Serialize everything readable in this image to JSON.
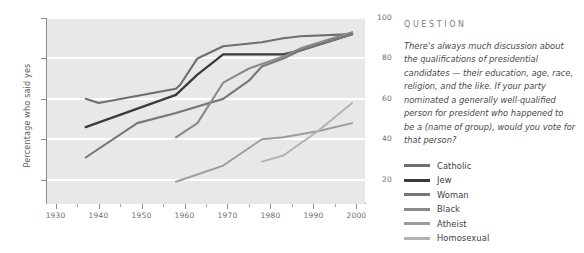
{
  "chart_data": {
    "type": "line",
    "title": "",
    "xlabel": "",
    "ylabel": "Percentage who said yes",
    "xlim": [
      1928,
      2002
    ],
    "ylim": [
      8,
      100
    ],
    "grid": true,
    "gridlines_y": [
      20,
      40,
      60,
      80,
      100
    ],
    "xticks": [
      1930,
      1940,
      1950,
      1960,
      1970,
      1980,
      1990,
      2000
    ],
    "xtick_labels": [
      "1930",
      "1940",
      "1950",
      "1960",
      "1970",
      "1980",
      "1990",
      "2000"
    ],
    "xticks_minor": [
      1935,
      1945,
      1955,
      1965,
      1975,
      1985,
      1995
    ],
    "yticks": [
      20,
      40,
      60,
      80,
      100
    ],
    "ytick_labels": [
      "20",
      "40",
      "60",
      "80",
      "100"
    ],
    "legend_position": "right",
    "series": [
      {
        "name": "Catholic",
        "color": "#6e6e6e",
        "width": 2.1,
        "points": [
          [
            1937,
            60
          ],
          [
            1940,
            58
          ],
          [
            1958,
            65
          ],
          [
            1959,
            67
          ],
          [
            1963,
            80
          ],
          [
            1969,
            86
          ],
          [
            1978,
            88
          ],
          [
            1983,
            90
          ],
          [
            1987,
            91
          ],
          [
            1999,
            92
          ]
        ]
      },
      {
        "name": "Jew",
        "color": "#3a3a3a",
        "width": 2.3,
        "points": [
          [
            1937,
            46
          ],
          [
            1958,
            62
          ],
          [
            1963,
            72
          ],
          [
            1969,
            82
          ],
          [
            1983,
            82
          ],
          [
            1987,
            84
          ],
          [
            1999,
            92
          ]
        ]
      },
      {
        "name": "Woman",
        "color": "#777777",
        "width": 2.1,
        "points": [
          [
            1937,
            31
          ],
          [
            1949,
            48
          ],
          [
            1958,
            53
          ],
          [
            1969,
            60
          ],
          [
            1975,
            69
          ],
          [
            1978,
            76
          ],
          [
            1983,
            80
          ],
          [
            1987,
            84
          ],
          [
            1999,
            92
          ]
        ]
      },
      {
        "name": "Black",
        "color": "#8a8a8a",
        "width": 2.1,
        "points": [
          [
            1958,
            41
          ],
          [
            1963,
            48
          ],
          [
            1969,
            68
          ],
          [
            1975,
            75
          ],
          [
            1983,
            81
          ],
          [
            1987,
            85
          ],
          [
            1999,
            93
          ]
        ]
      },
      {
        "name": "Atheist",
        "color": "#9c9c9c",
        "width": 1.9,
        "points": [
          [
            1958,
            19
          ],
          [
            1969,
            27
          ],
          [
            1978,
            40
          ],
          [
            1983,
            41
          ],
          [
            1991,
            44
          ],
          [
            1999,
            48
          ]
        ]
      },
      {
        "name": "Homosexual",
        "color": "#b2b2b2",
        "width": 1.9,
        "points": [
          [
            1978,
            29
          ],
          [
            1983,
            32
          ],
          [
            1991,
            44
          ],
          [
            1999,
            58
          ]
        ]
      }
    ]
  },
  "question": {
    "heading": "QUESTION",
    "body": "There's always much discussion about the qualifications of presidential candidates — their education, age, race, religion, and the like. If your party nominated a generally well-qualified person for president who happened to be a (name of group), would you vote for that person?"
  },
  "colors": {
    "plot_background": "#e8e8e8",
    "gridline": "#ffffff",
    "axis": "#8c8c8c",
    "tick_label": "#6e6e6e",
    "axis_label": "#5a5a5a",
    "heading": "#808080",
    "body_text": "#4a4a4a",
    "legend_text": "#3d3d3d"
  }
}
